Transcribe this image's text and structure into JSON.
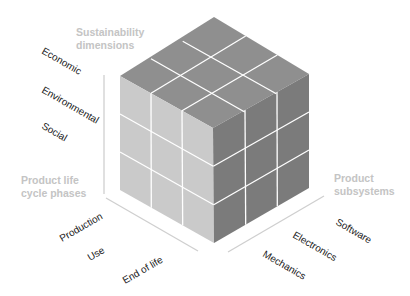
{
  "axes": {
    "sustainability": {
      "title_lines": [
        "Sustainability",
        "dimensions"
      ],
      "labels": [
        "Economic",
        "Environmental",
        "Social"
      ]
    },
    "lifecycle": {
      "title_lines": [
        "Product life",
        "cycle phases"
      ],
      "labels": [
        "Production",
        "Use",
        "End of life"
      ]
    },
    "subsystems": {
      "title_lines": [
        "Product",
        "subsystems"
      ],
      "labels": [
        "Software",
        "Electronics",
        "Mechanics"
      ]
    }
  },
  "colors": {
    "top_face": "#8f8f8f",
    "left_face": "#cacaca",
    "right_face": "#7b7b7b",
    "grid": "#ffffff",
    "axis_title": "#c4c4c4",
    "axis_line": "#cfcfcf",
    "label": "#1a1a1a"
  }
}
